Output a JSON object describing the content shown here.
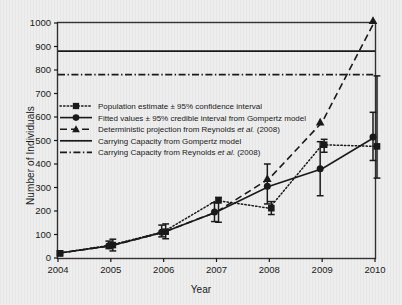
{
  "chart_data": {
    "type": "line",
    "title": "",
    "xlabel": "Year",
    "ylabel": "Number of Individuals",
    "x": [
      2004,
      2005,
      2006,
      2007,
      2008,
      2009,
      2010
    ],
    "xlim": [
      2004,
      2010
    ],
    "ylim": [
      0,
      1000
    ],
    "xticks": [
      "2004",
      "2005",
      "2006",
      "2007",
      "2008",
      "2009",
      "2010"
    ],
    "yticks": [
      "0",
      "100",
      "200",
      "300",
      "400",
      "500",
      "600",
      "700",
      "800",
      "900",
      "1000"
    ],
    "grid": false,
    "legend_position": "upper-left-inside",
    "series": [
      {
        "name": "Population estimate ± 95% confidence interval",
        "marker": "square",
        "line": "dotted",
        "values": [
          20,
          55,
          112,
          245,
          212,
          482,
          475
        ],
        "err_low": [
          20,
          30,
          82,
          152,
          185,
          450,
          340
        ],
        "err_high": [
          20,
          80,
          145,
          258,
          240,
          505,
          775
        ]
      },
      {
        "name": "Fitted values ± 95% credible interval from Gompertz model",
        "marker": "circle",
        "line": "solid",
        "values": [
          20,
          52,
          110,
          196,
          305,
          380,
          515
        ],
        "err_low": [
          20,
          40,
          90,
          155,
          230,
          265,
          415
        ],
        "err_high": [
          20,
          72,
          140,
          235,
          400,
          495,
          620
        ]
      },
      {
        "name": "Deterministic projection from Reynolds et al. (2008)",
        "marker": "triangle",
        "line": "dashed",
        "values": [
          20,
          52,
          110,
          196,
          338,
          578,
          1010
        ]
      }
    ],
    "reference_lines": [
      {
        "name": "Carrying Capacity from Gompertz model",
        "value": 880,
        "line": "solid"
      },
      {
        "name": "Carrying Capacity from Reynolds et al. (2008)",
        "value": 780,
        "line": "dash-dot"
      }
    ]
  },
  "legend": {
    "items": [
      {
        "label_pre": "Population estimate ± 95% confidence interval",
        "label_it": "",
        "label_post": "",
        "style": "dotted-square"
      },
      {
        "label_pre": "Fitted values ± 95% credible interval from Gompertz model",
        "label_it": "",
        "label_post": "",
        "style": "solid-circle"
      },
      {
        "label_pre": "Deterministic projection from Reynolds ",
        "label_it": "et al.",
        "label_post": " (2008)",
        "style": "dashed-triangle"
      },
      {
        "label_pre": "Carrying Capacity from Gompertz model",
        "label_it": "",
        "label_post": "",
        "style": "solid-line"
      },
      {
        "label_pre": "Carrying Capacity from Reynolds ",
        "label_it": "et al.",
        "label_post": " (2008)",
        "style": "dashdot-line"
      }
    ]
  },
  "colors": {
    "ink": "#1a1a1a",
    "frame": "#333333",
    "background": "#eeeeee"
  }
}
